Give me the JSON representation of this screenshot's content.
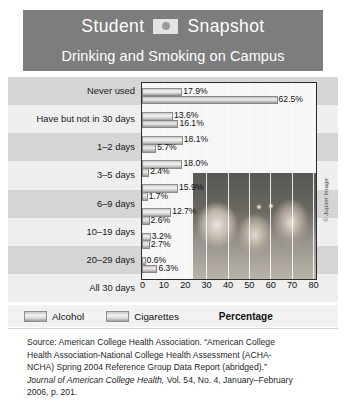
{
  "header": {
    "title_left": "Student",
    "title_right": "Snapshot",
    "badge_icon": "circle-dot-icon",
    "subtitle": "Drinking and Smoking on Campus"
  },
  "legend": {
    "series": [
      {
        "label": "Alcohol",
        "color": "#d9d9d9"
      },
      {
        "label": "Cigarettes",
        "color": "#cccccc"
      }
    ]
  },
  "credit": "© Jupiter Image",
  "source": {
    "line1": "Source: American College Health Association. “American College",
    "line2": "Health Association-National College Health Assessment (ACHA-",
    "line3": "NCHA) Spring 2004 Reference Group Data Report (abridged).”",
    "line4_italic": "Journal of American College Health,",
    "line4_rest": " Vol. 54, No. 4, January–February",
    "line5": "2006, p. 201."
  },
  "chart_data": {
    "type": "bar",
    "orientation": "horizontal",
    "title": "Drinking and Smoking on Campus",
    "xlabel": "Percentage",
    "ylabel": "",
    "xlim": [
      0,
      80
    ],
    "xticks": [
      0,
      10,
      20,
      30,
      40,
      50,
      60,
      70,
      80
    ],
    "grid": true,
    "legend_position": "bottom-left",
    "categories": [
      "Never used",
      "Have but not in 30 days",
      "1–2 days",
      "3–5 days",
      "6–9 days",
      "10–19 days",
      "20–29 days",
      "All 30 days"
    ],
    "series": [
      {
        "name": "Alcohol",
        "values": [
          17.9,
          13.6,
          18.1,
          18.0,
          15.9,
          12.7,
          3.2,
          0.6
        ],
        "labels": [
          "17.9%",
          "13.6%",
          "18.1%",
          "18.0%",
          "15.9%",
          "12.7%",
          "3.2%",
          "0.6%"
        ]
      },
      {
        "name": "Cigarettes",
        "values": [
          62.5,
          16.1,
          5.7,
          2.4,
          1.7,
          2.6,
          2.7,
          6.3
        ],
        "labels": [
          "62.5%",
          "16.1%",
          "5.7%",
          "2.4%",
          "1.7%",
          "2.6%",
          "2.7%",
          "6.3%"
        ]
      }
    ]
  }
}
